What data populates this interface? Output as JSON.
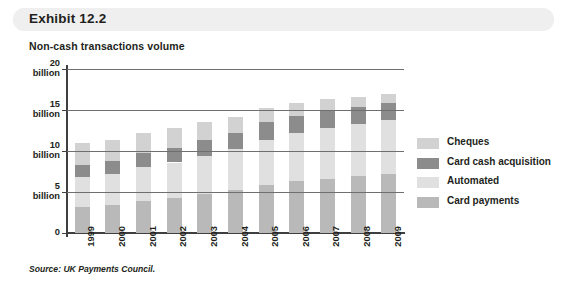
{
  "header": {
    "exhibit_label": "Exhibit 12.2",
    "subtitle": "Non-cash transactions volume"
  },
  "source_note": "Source: UK Payments Council.",
  "colors": {
    "cheques": "#d2d2d2",
    "card_cash_acquisition": "#8c8c8c",
    "automated": "#e0e0e0",
    "card_payments": "#b9b9b9",
    "header_bar": "#efeff0",
    "axis": "#3f3f3f",
    "gridline": "#6f6f6f"
  },
  "chart_data": {
    "type": "bar",
    "stacked": true,
    "title": "Non-cash transactions volume",
    "xlabel": "",
    "ylabel": "",
    "ylim": [
      0,
      20
    ],
    "yticks": [
      0,
      5,
      10,
      15,
      20
    ],
    "ytick_labels": [
      "0",
      "5\nbillion",
      "10\nbillion",
      "15\nbillion",
      "20\nbillion"
    ],
    "grid": true,
    "legend_position": "right",
    "categories": [
      "1999",
      "2000",
      "2001",
      "2002",
      "2003",
      "2004",
      "2005",
      "2006",
      "2007",
      "2008",
      "2009"
    ],
    "stack_order_bottom_to_top": [
      "Card payments",
      "Automated",
      "Card cash acquisition",
      "Cheques"
    ],
    "series": [
      {
        "name": "Card payments",
        "color": "#b9b9b9",
        "values": [
          3.2,
          3.4,
          3.9,
          4.3,
          4.8,
          5.3,
          5.9,
          6.3,
          6.6,
          6.9,
          7.2
        ]
      },
      {
        "name": "Automated",
        "color": "#e0e0e0",
        "values": [
          3.6,
          3.8,
          4.1,
          4.3,
          4.6,
          4.9,
          5.5,
          5.9,
          6.2,
          6.4,
          6.6
        ]
      },
      {
        "name": "Card cash acquisition",
        "color": "#8c8c8c",
        "values": [
          1.5,
          1.6,
          1.7,
          1.8,
          1.9,
          2.0,
          2.1,
          2.1,
          2.1,
          2.1,
          2.1
        ]
      },
      {
        "name": "Cheques",
        "color": "#d2d2d2",
        "values": [
          2.7,
          2.6,
          2.5,
          2.4,
          2.2,
          2.0,
          1.8,
          1.6,
          1.4,
          1.2,
          1.0
        ]
      }
    ],
    "totals": [
      11.0,
      11.4,
      12.2,
      12.8,
      13.5,
      14.2,
      15.3,
      15.9,
      16.3,
      16.6,
      16.9
    ]
  },
  "legend": {
    "items": [
      {
        "label": "Cheques",
        "color": "#d2d2d2"
      },
      {
        "label": "Card cash acquisition",
        "color": "#8c8c8c"
      },
      {
        "label": "Automated",
        "color": "#e0e0e0"
      },
      {
        "label": "Card payments",
        "color": "#b9b9b9"
      }
    ]
  }
}
